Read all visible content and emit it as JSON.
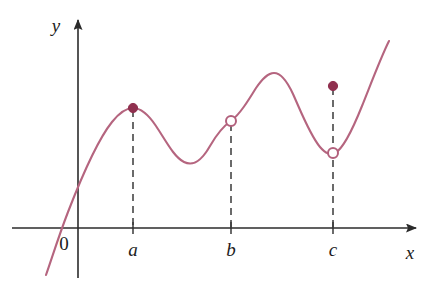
{
  "figure": {
    "background_color": "#ffffff"
  },
  "axes": {
    "x_axis_label": "x",
    "y_axis_label": "y",
    "origin_label": "0",
    "axis_color": "#2b2b2b",
    "x_axis_y_px": 228,
    "y_axis_x_px": 78,
    "x_axis_start_px": 12,
    "x_axis_end_px": 422,
    "y_axis_top_px": 14,
    "y_axis_bottom_px": 278
  },
  "tick_labels": [
    {
      "name": "a",
      "text": "a",
      "x_px": 133
    },
    {
      "name": "b",
      "text": "b",
      "x_px": 231
    },
    {
      "name": "c",
      "text": "c",
      "x_px": 333
    }
  ],
  "markers": [
    {
      "name": "filled-point-at-a",
      "kind": "filled",
      "x_px": 133,
      "y_px": 108,
      "color": "#90304f",
      "radius": 4.6
    },
    {
      "name": "open-point-at-b",
      "kind": "open",
      "x_px": 231,
      "y_px": 121,
      "color": "#b2607c",
      "fill": "#ffffff",
      "radius": 5.0
    },
    {
      "name": "filled-point-above-c",
      "kind": "filled",
      "x_px": 333,
      "y_px": 86,
      "color": "#90304f",
      "radius": 4.6
    },
    {
      "name": "open-point-at-c",
      "kind": "open",
      "x_px": 333,
      "y_px": 153,
      "color": "#b2607c",
      "fill": "#ffffff",
      "radius": 5.0
    }
  ],
  "dashed_guides": [
    {
      "name": "guide-a",
      "x_px": 133,
      "y_top_px": 110,
      "y_bottom_px": 228
    },
    {
      "name": "guide-b",
      "x_px": 231,
      "y_top_px": 124,
      "y_bottom_px": 228
    },
    {
      "name": "guide-c",
      "x_px": 333,
      "y_top_px": 88,
      "y_bottom_px": 228
    }
  ],
  "chart_data": {
    "type": "line",
    "xlabel": "x",
    "ylabel": "y",
    "grid": false,
    "legend": null,
    "curve_color": "#b5657f",
    "annotations": [
      "filled point at x = a (local maximum, function value attained)",
      "open circle at x = b (value not attained on the curve)",
      "filled point above x = c (function value at c, off the curve)",
      "open circle at x = c (limit value, not attained)"
    ],
    "curve_path_px": "M 46 275 C 52 258 58 238 68 212 C 80 181 96 142 112 122 C 120 112 126 108 133 108 C 141 108 148 114 156 126 C 166 141 174 157 184 162 C 194 167 202 160 210 146 C 218 132 225 125 231 121 C 240 114 248 101 256 88 C 263 78 268 73 274 73 C 281 73 287 81 293 94 C 302 114 310 135 320 147 C 326 154 330 155 335 153 C 343 149 352 131 362 106 C 372 81 381 57 389 41",
    "feature_points_px": [
      {
        "label": "curve-start-bottom-left",
        "x": 46,
        "y": 275
      },
      {
        "label": "x-intercept",
        "x": 56,
        "y": 228
      },
      {
        "label": "y-intercept",
        "x": 78,
        "y": 180
      },
      {
        "label": "local-max-at-a",
        "x": 133,
        "y": 108
      },
      {
        "label": "local-min-between-a-and-b",
        "x": 185,
        "y": 163
      },
      {
        "label": "point-at-b",
        "x": 231,
        "y": 121
      },
      {
        "label": "local-max-between-b-and-c",
        "x": 274,
        "y": 73
      },
      {
        "label": "local-min-at-c",
        "x": 333,
        "y": 153
      },
      {
        "label": "curve-end-top-right",
        "x": 389,
        "y": 41
      }
    ]
  }
}
